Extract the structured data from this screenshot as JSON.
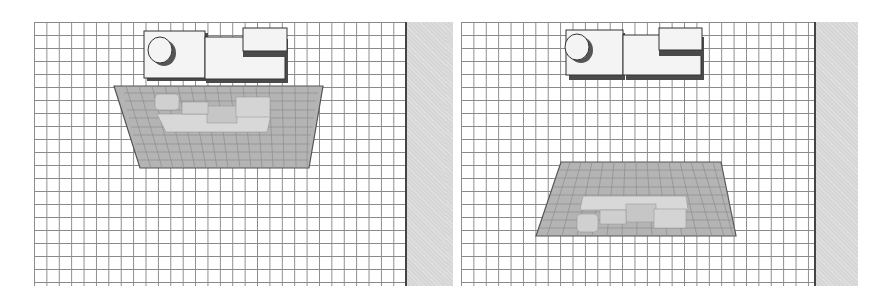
{
  "figure": {
    "panels": [
      {
        "id": "left",
        "description": "Viewport with virtual object projected onto plane near the physical object (upper position)",
        "grid": {
          "x": 34,
          "y": 22,
          "width": 372,
          "height": 264,
          "cell": 13
        },
        "side_strip": {
          "x": 407,
          "y": 22,
          "width": 46,
          "height": 264,
          "color": "#d6d6d6"
        },
        "object": {
          "x": 144,
          "y": 30,
          "label": "physical-model"
        },
        "projection_plane": {
          "points": "114,86 323,86 309,168 140,168",
          "color": "#a8a8a8"
        }
      },
      {
        "id": "right",
        "description": "Viewport with virtual object projected onto plane lower in the view",
        "grid": {
          "x": 461,
          "y": 22,
          "width": 354,
          "height": 264,
          "cell": 13
        },
        "side_strip": {
          "x": 815,
          "y": 22,
          "width": 43,
          "height": 264,
          "color": "#d6d6d6"
        },
        "object": {
          "x": 566,
          "y": 29,
          "label": "physical-model"
        },
        "projection_plane": {
          "points": "561,162 721,162 736,236 536,236",
          "color": "#a8a8a8"
        }
      }
    ],
    "colors": {
      "grid_line": "#8a8a8a",
      "background": "#ffffff",
      "object_face": "#f4f4f4",
      "object_shadow": "#4a4a4a",
      "plane_fill": "#b4b4b4",
      "plane_edge": "#555555"
    }
  }
}
